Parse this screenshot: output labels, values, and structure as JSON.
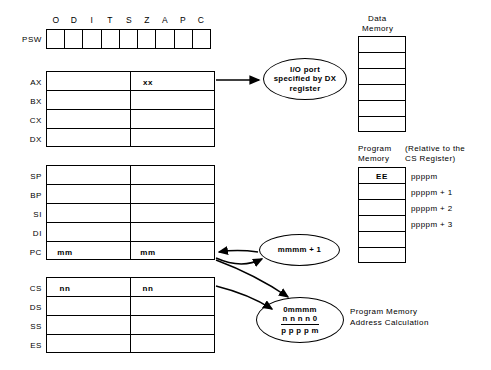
{
  "diagram": {
    "psw": {
      "label": "PSW",
      "flags": [
        "O",
        "D",
        "I",
        "T",
        "S",
        "Z",
        "A",
        "P",
        "C"
      ],
      "values": [
        "",
        "",
        "",
        "",
        "",
        "",
        "",
        "",
        ""
      ]
    },
    "general_registers": {
      "labels": [
        "AX",
        "BX",
        "CX",
        "DX"
      ],
      "high_values": [
        "",
        "",
        "",
        ""
      ],
      "low_values": [
        "xx",
        "",
        "",
        ""
      ]
    },
    "pointer_registers": {
      "labels": [
        "SP",
        "BP",
        "SI",
        "DI",
        "PC"
      ],
      "high_values": [
        "",
        "",
        "",
        "",
        "mm"
      ],
      "low_values": [
        "",
        "",
        "",
        "",
        "mm"
      ]
    },
    "segment_registers": {
      "labels": [
        "CS",
        "DS",
        "SS",
        "ES"
      ],
      "high_values": [
        "nn",
        "",
        "",
        ""
      ],
      "low_values": [
        "nn",
        "",
        "",
        ""
      ]
    },
    "data_memory": {
      "title_line1": "Data",
      "title_line2": "Memory",
      "cells": [
        "",
        "",
        "",
        "",
        "",
        ""
      ]
    },
    "program_memory": {
      "title_line1": "Program",
      "title_line2": "Memory",
      "relative_line1": "(Relative to the",
      "relative_line2": "CS Register)",
      "cells": [
        "EE",
        "",
        "",
        "",
        "",
        ""
      ],
      "addresses": [
        "ppppm",
        "ppppm + 1",
        "ppppm + 2",
        "ppppm + 3"
      ]
    },
    "io_ellipse": {
      "line1": "I/O port",
      "line2": "specified  by  DX",
      "line3": "register"
    },
    "pc_increment_ellipse": {
      "line1": "mmmm + 1"
    },
    "address_calc_ellipse": {
      "line1": "0mmmm",
      "line2": "n n n n 0",
      "line3": "p p p p m"
    },
    "address_calc_caption": {
      "line1": "Program Memory",
      "line2": "Address Calculation"
    }
  }
}
